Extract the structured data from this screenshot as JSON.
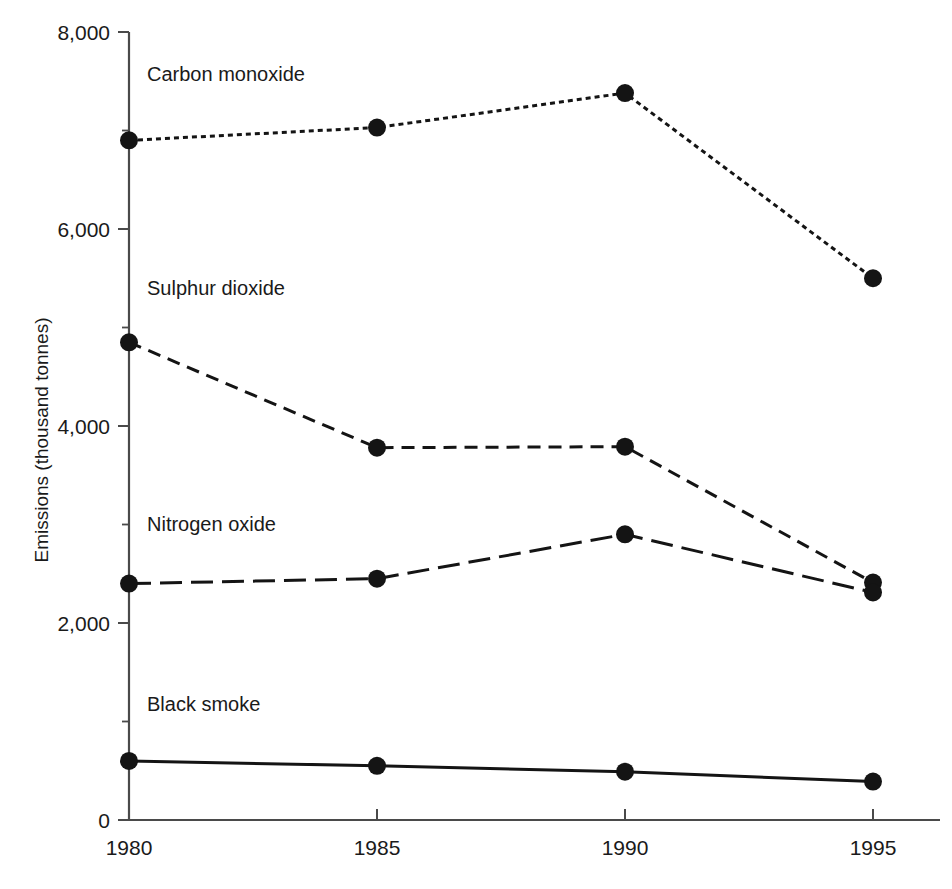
{
  "chart_data": {
    "type": "line",
    "title": "",
    "xlabel": "",
    "ylabel": "Emissions (thousand tonnes)",
    "x": [
      1980,
      1985,
      1990,
      1995
    ],
    "categories": [
      "1980",
      "1985",
      "1990",
      "1995"
    ],
    "xlim": [
      1980,
      1995
    ],
    "ylim": [
      0,
      8000
    ],
    "grid": false,
    "legend": "inline-labels",
    "y_ticks": [
      0,
      2000,
      4000,
      6000,
      8000
    ],
    "y_tick_labels": [
      "0",
      "2,000",
      "4,000",
      "6,000",
      "8,000"
    ],
    "y_minor_tick_interval": 1000,
    "series": [
      {
        "name": "Carbon monoxide",
        "values": [
          6900,
          7030,
          7380,
          5500
        ],
        "linestyle": "dotted",
        "dasharray": "5,4",
        "marker": "circle",
        "label_x": 1980,
        "label_y": 7500
      },
      {
        "name": "Sulphur dioxide",
        "values": [
          4850,
          3780,
          3790,
          2410
        ],
        "linestyle": "dashed",
        "dasharray": "13,8",
        "marker": "circle",
        "label_x": 1980,
        "label_y": 5330
      },
      {
        "name": "Nitrogen oxide",
        "values": [
          2400,
          2450,
          2900,
          2310
        ],
        "linestyle": "long-dashed",
        "dasharray": "22,9",
        "marker": "circle",
        "label_x": 1980,
        "label_y": 2930
      },
      {
        "name": "Black smoke",
        "values": [
          600,
          550,
          490,
          390
        ],
        "linestyle": "solid",
        "dasharray": "none",
        "marker": "circle",
        "label_x": 1980,
        "label_y": 1110
      }
    ]
  },
  "axis": {
    "y_title": "Emissions (thousand tonnes)"
  },
  "colors": {
    "ink": "#141414",
    "axis": "#4a4a4a",
    "background": "#ffffff"
  }
}
